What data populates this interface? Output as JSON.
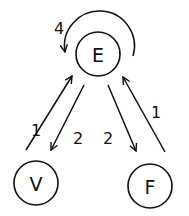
{
  "diagram": {
    "type": "directed-graph",
    "nodes": [
      {
        "id": "E",
        "label": "E",
        "cx": 98,
        "cy": 54,
        "r": 22
      },
      {
        "id": "V",
        "label": "V",
        "cx": 36,
        "cy": 183,
        "r": 22
      },
      {
        "id": "F",
        "label": "F",
        "cx": 150,
        "cy": 186,
        "r": 22
      }
    ],
    "edges": [
      {
        "from": "E",
        "to": "E",
        "label": "4",
        "kind": "self-loop"
      },
      {
        "from": "V",
        "to": "E",
        "label": "1"
      },
      {
        "from": "E",
        "to": "V",
        "label": "2"
      },
      {
        "from": "E",
        "to": "F",
        "label": "2"
      },
      {
        "from": "F",
        "to": "E",
        "label": "1"
      }
    ]
  },
  "labels": {
    "node_e": "E",
    "node_v": "V",
    "node_f": "F",
    "loop_e": "4",
    "v_to_e": "1",
    "e_to_v": "2",
    "e_to_f": "2",
    "f_to_e": "1"
  },
  "colors": {
    "stroke": "#111111",
    "background": "#ffffff"
  }
}
